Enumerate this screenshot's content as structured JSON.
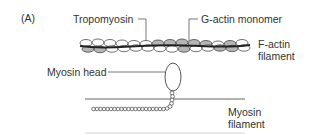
{
  "figure": {
    "panel_label": "(A)",
    "labels": {
      "tropomyosin": "Tropomyosin",
      "g_actin": "G-actin monomer",
      "f_actin_line1": "F-actin",
      "f_actin_line2": "filament",
      "myosin_head": "Myosin head",
      "myosin_filament_line1": "Myosin",
      "myosin_filament_line2": "filament"
    },
    "colors": {
      "text": "#333333",
      "line": "#555555",
      "g_actin_fill": "#b5b5b5",
      "g_actin_light_fill": "#ffffff",
      "tropomyosin_strand": "#2a2a2a",
      "baseline": "#cfcfcf"
    }
  }
}
